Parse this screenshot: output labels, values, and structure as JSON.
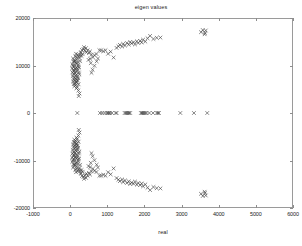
{
  "figure": {
    "title": "eigen values",
    "width": 302,
    "height": 246,
    "background": "#ffffff",
    "axes_color": "#9a9a9a",
    "marker_color": "#3c3c3c"
  },
  "axis": {
    "xlabel": "real",
    "ylabel": "imag",
    "xticklabels": [
      "-1000",
      "0",
      "1000",
      "2000",
      "3000",
      "4000",
      "5000",
      "6000"
    ],
    "yticklabels": [
      "20000",
      "10000",
      "0",
      "-10000",
      "-20000"
    ]
  },
  "chart_data": {
    "type": "scatter",
    "title": "eigen values",
    "xlabel": "real",
    "ylabel": "imag",
    "xlim": [
      -1000,
      6000
    ],
    "ylim": [
      -20000,
      20000
    ],
    "xticks": [
      -1000,
      0,
      1000,
      2000,
      3000,
      4000,
      5000,
      6000
    ],
    "yticks": [
      -20000,
      -10000,
      0,
      10000,
      20000
    ],
    "grid": false,
    "legend": null,
    "marker": "x",
    "marker_color": "#3c3c3c",
    "series": [
      {
        "name": "eigenvalues",
        "points": [
          [
            120,
            12100
          ],
          [
            60,
            11600
          ],
          [
            95,
            11250
          ],
          [
            150,
            11900
          ],
          [
            210,
            12050
          ],
          [
            75,
            10950
          ],
          [
            130,
            10700
          ],
          [
            40,
            10400
          ],
          [
            185,
            10850
          ],
          [
            100,
            10200
          ],
          [
            55,
            10050
          ],
          [
            165,
            10500
          ],
          [
            205,
            10250
          ],
          [
            85,
            9800
          ],
          [
            145,
            9650
          ],
          [
            35,
            9500
          ],
          [
            195,
            9900
          ],
          [
            115,
            9350
          ],
          [
            65,
            9150
          ],
          [
            175,
            9450
          ],
          [
            225,
            9700
          ],
          [
            90,
            8950
          ],
          [
            140,
            8800
          ],
          [
            45,
            8650
          ],
          [
            190,
            9050
          ],
          [
            110,
            8500
          ],
          [
            70,
            8300
          ],
          [
            160,
            8150
          ],
          [
            215,
            8600
          ],
          [
            125,
            8000
          ],
          [
            50,
            7850
          ],
          [
            180,
            7700
          ],
          [
            95,
            7550
          ],
          [
            135,
            7350
          ],
          [
            230,
            8250
          ],
          [
            75,
            7200
          ],
          [
            155,
            7050
          ],
          [
            105,
            6850
          ],
          [
            200,
            7400
          ],
          [
            60,
            6700
          ],
          [
            145,
            6500
          ],
          [
            185,
            6950
          ],
          [
            115,
            6300
          ],
          [
            80,
            6150
          ],
          [
            165,
            6650
          ],
          [
            210,
            6100
          ],
          [
            130,
            5900
          ],
          [
            95,
            5700
          ],
          [
            175,
            5500
          ],
          [
            150,
            5250
          ],
          [
            205,
            4800
          ],
          [
            235,
            4150
          ],
          [
            215,
            3600
          ],
          [
            105,
            11000
          ],
          [
            160,
            11400
          ],
          [
            230,
            11700
          ],
          [
            250,
            12250
          ],
          [
            190,
            12400
          ],
          [
            140,
            12600
          ],
          [
            255,
            11050
          ],
          [
            275,
            12900
          ],
          [
            300,
            13400
          ],
          [
            345,
            13600
          ],
          [
            380,
            13250
          ],
          [
            420,
            12900
          ],
          [
            320,
            12500
          ],
          [
            290,
            12150
          ],
          [
            265,
            12750
          ],
          [
            360,
            14000
          ],
          [
            410,
            13800
          ],
          [
            455,
            13350
          ],
          [
            490,
            12750
          ],
          [
            520,
            13100
          ],
          [
            560,
            12400
          ],
          [
            600,
            11850
          ],
          [
            640,
            12300
          ],
          [
            695,
            12550
          ],
          [
            735,
            11600
          ],
          [
            775,
            13350
          ],
          [
            820,
            13300
          ],
          [
            880,
            13150
          ],
          [
            940,
            13350
          ],
          [
            1010,
            12600
          ],
          [
            1080,
            13050
          ],
          [
            1160,
            11800
          ],
          [
            1240,
            13850
          ],
          [
            1290,
            14200
          ],
          [
            1330,
            14500
          ],
          [
            1390,
            14150
          ],
          [
            1420,
            14700
          ],
          [
            1470,
            14350
          ],
          [
            1520,
            14900
          ],
          [
            1570,
            14550
          ],
          [
            1610,
            15100
          ],
          [
            1650,
            14800
          ],
          [
            1700,
            15050
          ],
          [
            1740,
            14600
          ],
          [
            1790,
            15250
          ],
          [
            1830,
            14900
          ],
          [
            1880,
            15350
          ],
          [
            1920,
            15000
          ],
          [
            1960,
            15600
          ],
          [
            2020,
            15200
          ],
          [
            2080,
            15900
          ],
          [
            2150,
            16400
          ],
          [
            2240,
            15750
          ],
          [
            2330,
            16000
          ],
          [
            2430,
            16050
          ],
          [
            560,
            8550
          ],
          [
            590,
            9200
          ],
          [
            640,
            10050
          ],
          [
            700,
            11000
          ],
          [
            540,
            10600
          ],
          [
            480,
            11300
          ],
          [
            520,
            11550
          ],
          [
            3530,
            17200
          ],
          [
            3580,
            17650
          ],
          [
            3640,
            17050
          ],
          [
            3660,
            17550
          ],
          [
            3630,
            16750
          ],
          [
            120,
            -12100
          ],
          [
            60,
            -11600
          ],
          [
            95,
            -11250
          ],
          [
            150,
            -11900
          ],
          [
            210,
            -12050
          ],
          [
            75,
            -10950
          ],
          [
            130,
            -10700
          ],
          [
            40,
            -10400
          ],
          [
            185,
            -10850
          ],
          [
            100,
            -10200
          ],
          [
            55,
            -10050
          ],
          [
            165,
            -10500
          ],
          [
            205,
            -10250
          ],
          [
            85,
            -9800
          ],
          [
            145,
            -9650
          ],
          [
            35,
            -9500
          ],
          [
            195,
            -9900
          ],
          [
            115,
            -9350
          ],
          [
            65,
            -9150
          ],
          [
            175,
            -9450
          ],
          [
            225,
            -9700
          ],
          [
            90,
            -8950
          ],
          [
            140,
            -8800
          ],
          [
            45,
            -8650
          ],
          [
            190,
            -9050
          ],
          [
            110,
            -8500
          ],
          [
            70,
            -8300
          ],
          [
            160,
            -8150
          ],
          [
            215,
            -8600
          ],
          [
            125,
            -8000
          ],
          [
            50,
            -7850
          ],
          [
            180,
            -7700
          ],
          [
            95,
            -7550
          ],
          [
            135,
            -7350
          ],
          [
            230,
            -8250
          ],
          [
            75,
            -7200
          ],
          [
            155,
            -7050
          ],
          [
            105,
            -6850
          ],
          [
            200,
            -7400
          ],
          [
            60,
            -6700
          ],
          [
            145,
            -6500
          ],
          [
            185,
            -6950
          ],
          [
            115,
            -6300
          ],
          [
            80,
            -6150
          ],
          [
            165,
            -6650
          ],
          [
            210,
            -6100
          ],
          [
            130,
            -5900
          ],
          [
            95,
            -5700
          ],
          [
            175,
            -5500
          ],
          [
            150,
            -5250
          ],
          [
            205,
            -4800
          ],
          [
            235,
            -4150
          ],
          [
            215,
            -3600
          ],
          [
            105,
            -11000
          ],
          [
            160,
            -11400
          ],
          [
            230,
            -11700
          ],
          [
            250,
            -12250
          ],
          [
            190,
            -12400
          ],
          [
            140,
            -12600
          ],
          [
            255,
            -11050
          ],
          [
            275,
            -12900
          ],
          [
            300,
            -13400
          ],
          [
            345,
            -13600
          ],
          [
            380,
            -13250
          ],
          [
            420,
            -12900
          ],
          [
            320,
            -12500
          ],
          [
            290,
            -12150
          ],
          [
            265,
            -12750
          ],
          [
            360,
            -14000
          ],
          [
            410,
            -13800
          ],
          [
            455,
            -13350
          ],
          [
            490,
            -12750
          ],
          [
            520,
            -13100
          ],
          [
            560,
            -12400
          ],
          [
            600,
            -11850
          ],
          [
            640,
            -12300
          ],
          [
            695,
            -12550
          ],
          [
            735,
            -11600
          ],
          [
            775,
            -13350
          ],
          [
            820,
            -13300
          ],
          [
            880,
            -13150
          ],
          [
            940,
            -13350
          ],
          [
            1010,
            -12600
          ],
          [
            1080,
            -13050
          ],
          [
            1160,
            -11800
          ],
          [
            1240,
            -13850
          ],
          [
            1290,
            -14200
          ],
          [
            1330,
            -14500
          ],
          [
            1390,
            -14150
          ],
          [
            1420,
            -14700
          ],
          [
            1470,
            -14350
          ],
          [
            1520,
            -14900
          ],
          [
            1570,
            -14550
          ],
          [
            1610,
            -15100
          ],
          [
            1650,
            -14800
          ],
          [
            1700,
            -15050
          ],
          [
            1740,
            -14600
          ],
          [
            1790,
            -15250
          ],
          [
            1830,
            -14900
          ],
          [
            1880,
            -15350
          ],
          [
            1920,
            -15000
          ],
          [
            1960,
            -15600
          ],
          [
            2020,
            -15200
          ],
          [
            2080,
            -15900
          ],
          [
            2150,
            -16400
          ],
          [
            2240,
            -15750
          ],
          [
            2330,
            -16000
          ],
          [
            2430,
            -16050
          ],
          [
            560,
            -8550
          ],
          [
            590,
            -9200
          ],
          [
            640,
            -10050
          ],
          [
            700,
            -11000
          ],
          [
            540,
            -10600
          ],
          [
            480,
            -11300
          ],
          [
            520,
            -11550
          ],
          [
            3530,
            -17200
          ],
          [
            3580,
            -17650
          ],
          [
            3640,
            -17050
          ],
          [
            3660,
            -17550
          ],
          [
            3630,
            -16750
          ],
          [
            175,
            0
          ],
          [
            790,
            0
          ],
          [
            850,
            0
          ],
          [
            915,
            0
          ],
          [
            975,
            0
          ],
          [
            1005,
            0
          ],
          [
            1030,
            0
          ],
          [
            1060,
            0
          ],
          [
            1115,
            0
          ],
          [
            1215,
            0
          ],
          [
            1240,
            0
          ],
          [
            1460,
            0
          ],
          [
            1490,
            0
          ],
          [
            1520,
            0
          ],
          [
            1555,
            0
          ],
          [
            1580,
            0
          ],
          [
            1610,
            0
          ],
          [
            1900,
            0
          ],
          [
            1930,
            0
          ],
          [
            1960,
            0
          ],
          [
            1990,
            0
          ],
          [
            2020,
            0
          ],
          [
            2050,
            0
          ],
          [
            2130,
            0
          ],
          [
            2230,
            0
          ],
          [
            2330,
            0
          ],
          [
            2360,
            0
          ],
          [
            2390,
            0
          ],
          [
            2970,
            0
          ],
          [
            3340,
            0
          ],
          [
            3700,
            0
          ]
        ]
      }
    ]
  }
}
